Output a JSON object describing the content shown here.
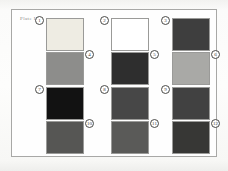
{
  "plate": {
    "caption": "Plate I",
    "frame_color": "#a8a8a6",
    "background_color": "#fdfdfc"
  },
  "chart_data": {
    "type": "table",
    "title": "Plate I",
    "xlabel": "",
    "ylabel": "",
    "categories": [
      "1",
      "2",
      "3",
      "4",
      "5",
      "6",
      "7",
      "8",
      "9",
      "10",
      "11",
      "12"
    ],
    "values": [
      94,
      100,
      26,
      57,
      18,
      68,
      8,
      32,
      28,
      41,
      43,
      22
    ],
    "series": [
      {
        "name": "Reflectance (%)",
        "values": [
          94,
          100,
          26,
          57,
          18,
          68,
          8,
          32,
          28,
          41,
          43,
          22
        ]
      }
    ],
    "swatches": [
      {
        "number": "1",
        "label": "①",
        "color": "#eeece3",
        "reflectance": 94,
        "marker_side": "left"
      },
      {
        "number": "2",
        "label": "②",
        "color": "#ffffff",
        "reflectance": 100,
        "marker_side": "left"
      },
      {
        "number": "3",
        "label": "③",
        "color": "#3e3e3e",
        "reflectance": 26,
        "marker_side": "left"
      },
      {
        "number": "4",
        "label": "④",
        "color": "#8d8d8b",
        "reflectance": 57,
        "marker_side": "right"
      },
      {
        "number": "5",
        "label": "⑤",
        "color": "#2e2e2e",
        "reflectance": 18,
        "marker_side": "right"
      },
      {
        "number": "6",
        "label": "⑥",
        "color": "#a9a9a6",
        "reflectance": 68,
        "marker_side": "right"
      },
      {
        "number": "7",
        "label": "⑦",
        "color": "#121212",
        "reflectance": 8,
        "marker_side": "left"
      },
      {
        "number": "8",
        "label": "⑧",
        "color": "#474747",
        "reflectance": 32,
        "marker_side": "left"
      },
      {
        "number": "9",
        "label": "⑨",
        "color": "#414141",
        "reflectance": 28,
        "marker_side": "left"
      },
      {
        "number": "10",
        "label": "⑩",
        "color": "#565654",
        "reflectance": 41,
        "marker_side": "right"
      },
      {
        "number": "11",
        "label": "⑪",
        "color": "#5a5a58",
        "reflectance": 43,
        "marker_side": "right"
      },
      {
        "number": "12",
        "label": "⑫",
        "color": "#373735",
        "reflectance": 22,
        "marker_side": "right"
      }
    ],
    "grid": {
      "rows": 4,
      "cols": 3
    },
    "legend_position": "none"
  }
}
